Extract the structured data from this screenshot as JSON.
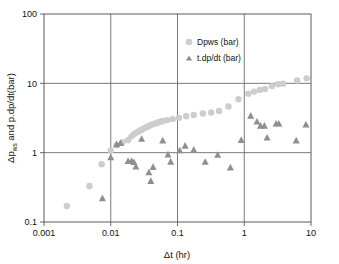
{
  "chart_data": {
    "type": "scatter",
    "title": "",
    "xlabel": "Δt (hr)",
    "ylabel": "Δp_ws and p.dp/dt(bar)",
    "ylabel_parts": {
      "pre": "Δp",
      "sub": "ws",
      "post": " and p.dp/dt(bar)"
    },
    "xscale": "log",
    "yscale": "log",
    "xlim": [
      0.001,
      10
    ],
    "ylim": [
      0.1,
      100
    ],
    "xticks": [
      0.001,
      0.01,
      0.1,
      1,
      10
    ],
    "xtick_labels": [
      "0.001",
      "0.01",
      "0.1",
      "1",
      "10"
    ],
    "yticks": [
      0.1,
      1,
      10,
      100
    ],
    "ytick_labels": [
      "0.1",
      "1",
      "10",
      "100"
    ],
    "grid": "major-xy",
    "legend_position": "top-right-inside",
    "series": [
      {
        "name": "Dpws (bar)",
        "marker": "circle",
        "color": "#cdcdcd",
        "points": [
          [
            0.0022,
            0.17
          ],
          [
            0.0048,
            0.33
          ],
          [
            0.0073,
            0.68
          ],
          [
            0.01,
            1.08
          ],
          [
            0.0123,
            1.28
          ],
          [
            0.0152,
            1.42
          ],
          [
            0.0182,
            1.52
          ],
          [
            0.0205,
            1.72
          ],
          [
            0.0222,
            1.85
          ],
          [
            0.0238,
            1.93
          ],
          [
            0.0252,
            1.98
          ],
          [
            0.0268,
            2.05
          ],
          [
            0.0286,
            2.12
          ],
          [
            0.0305,
            2.2
          ],
          [
            0.0325,
            2.28
          ],
          [
            0.0348,
            2.35
          ],
          [
            0.0372,
            2.42
          ],
          [
            0.0398,
            2.5
          ],
          [
            0.0425,
            2.56
          ],
          [
            0.0455,
            2.62
          ],
          [
            0.0487,
            2.68
          ],
          [
            0.0521,
            2.74
          ],
          [
            0.0558,
            2.8
          ],
          [
            0.0597,
            2.86
          ],
          [
            0.07,
            2.95
          ],
          [
            0.085,
            3.05
          ],
          [
            0.105,
            3.18
          ],
          [
            0.135,
            3.35
          ],
          [
            0.175,
            3.5
          ],
          [
            0.24,
            3.68
          ],
          [
            0.32,
            3.8
          ],
          [
            0.42,
            4.0
          ],
          [
            0.58,
            4.65
          ],
          [
            0.82,
            5.9
          ],
          [
            1.15,
            7.1
          ],
          [
            1.4,
            7.6
          ],
          [
            1.7,
            8.0
          ],
          [
            2.05,
            8.3
          ],
          [
            2.6,
            9.1
          ],
          [
            3.2,
            9.7
          ],
          [
            3.8,
            9.9
          ],
          [
            6.2,
            11.0
          ],
          [
            8.6,
            11.8
          ]
        ]
      },
      {
        "name": "t.dp/dt (bar)",
        "marker": "triangle",
        "color": "#8f8f8f",
        "points": [
          [
            0.0075,
            0.22
          ],
          [
            0.01,
            0.86
          ],
          [
            0.0122,
            1.32
          ],
          [
            0.014,
            1.38
          ],
          [
            0.0182,
            0.76
          ],
          [
            0.0205,
            0.76
          ],
          [
            0.0222,
            0.73
          ],
          [
            0.0238,
            0.63
          ],
          [
            0.029,
            1.58
          ],
          [
            0.0372,
            0.52
          ],
          [
            0.0398,
            0.39
          ],
          [
            0.043,
            0.62
          ],
          [
            0.06,
            1.5
          ],
          [
            0.072,
            0.94
          ],
          [
            0.079,
            0.74
          ],
          [
            0.108,
            1.08
          ],
          [
            0.13,
            1.26
          ],
          [
            0.175,
            1.1
          ],
          [
            0.26,
            0.74
          ],
          [
            0.4,
            0.93
          ],
          [
            0.62,
            0.61
          ],
          [
            0.9,
            1.52
          ],
          [
            1.25,
            3.4
          ],
          [
            1.55,
            2.8
          ],
          [
            1.75,
            2.45
          ],
          [
            2.0,
            2.45
          ],
          [
            2.2,
            1.65
          ],
          [
            3.0,
            2.62
          ],
          [
            3.3,
            2.62
          ],
          [
            6.0,
            1.5
          ],
          [
            8.4,
            2.55
          ]
        ]
      }
    ]
  }
}
